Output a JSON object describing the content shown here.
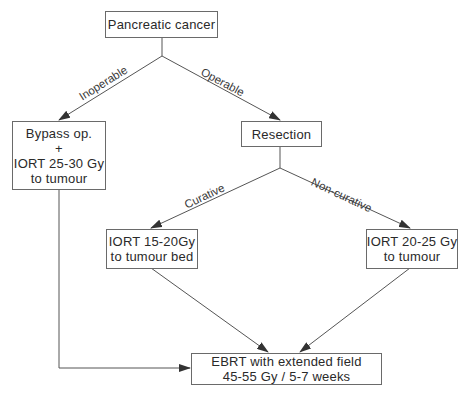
{
  "nodes": {
    "root": {
      "lines": [
        "Pancreatic cancer"
      ]
    },
    "bypass": {
      "lines": [
        "Bypass op.",
        "+",
        "IORT  25-30 Gy",
        "to tumour"
      ]
    },
    "resection": {
      "lines": [
        "Resection"
      ]
    },
    "curative_tx": {
      "lines": [
        "IORT  15-20Gy",
        "to tumour bed"
      ]
    },
    "noncurative_tx": {
      "lines": [
        "IORT  20-25 Gy",
        "to tumour"
      ]
    },
    "ebrt": {
      "lines": [
        "EBRT  with  extended  field",
        "45-55 Gy / 5-7  weeks"
      ]
    }
  },
  "edges": {
    "inoperable": "Inoperable",
    "operable": "Operable",
    "curative": "Curative",
    "noncurative": "Non-curative"
  },
  "colors": {
    "line": "#4a4a4a",
    "text": "#2a2a2a"
  }
}
